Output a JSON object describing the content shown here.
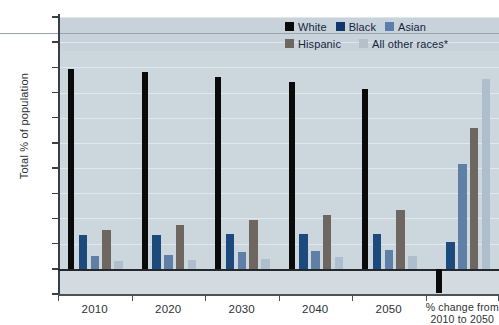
{
  "chart": {
    "type": "bar",
    "ylabel": "Total % of population",
    "ytick_labels": [
      "100",
      "90",
      "80",
      "70",
      "60",
      "50",
      "40",
      "30",
      "20",
      "10",
      "0",
      "-10"
    ],
    "xtick_labels": [
      "2010",
      "2020",
      "2030",
      "2040",
      "2050",
      "% change from\n2010 to 2050"
    ],
    "footnote": ""
  },
  "legend": {
    "row1": [
      {
        "label": "White",
        "color": "#0a0a0a",
        "swatch": "sw-white"
      },
      {
        "label": "Black",
        "color": "#10386b",
        "swatch": "sw-black"
      },
      {
        "label": "Asian",
        "color": "#5a7fad",
        "swatch": "sw-asian"
      }
    ],
    "row2": [
      {
        "label": "Hispanic",
        "color": "#6d6661",
        "swatch": "sw-hispanic"
      },
      {
        "label": "All other races*",
        "color": "#b3c1cd",
        "swatch": "sw-other"
      }
    ]
  },
  "chart_data": {
    "type": "bar",
    "title": "",
    "subtitle": "",
    "xlabel": "",
    "ylabel": "Total % of population",
    "categories": [
      "2010",
      "2020",
      "2030",
      "2040",
      "2050",
      "% change from 2010 to 2050"
    ],
    "series": [
      {
        "name": "White",
        "color": "#0a0a0a",
        "values": [
          79.5,
          78.0,
          76.0,
          74.0,
          71.5,
          -9.5
        ]
      },
      {
        "name": "Black",
        "color": "#1c4a7d",
        "values": [
          13.5,
          13.5,
          13.8,
          14.0,
          14.0,
          10.5
        ]
      },
      {
        "name": "Asian",
        "color": "#5f7fa6",
        "values": [
          5.0,
          5.5,
          6.5,
          7.0,
          7.5,
          41.5
        ]
      },
      {
        "name": "Hispanic",
        "color": "#6d6661",
        "values": [
          15.5,
          17.5,
          19.5,
          21.5,
          23.5,
          56.0
        ]
      },
      {
        "name": "All other races*",
        "color": "#aebecd",
        "values": [
          3.0,
          3.5,
          4.0,
          4.5,
          5.0,
          75.5
        ]
      }
    ],
    "ylim": [
      -10,
      100
    ],
    "ytick_values": [
      -10,
      0,
      10,
      20,
      30,
      40,
      50,
      60,
      70,
      80,
      90,
      100
    ],
    "grid": true,
    "legend_position": "top-right",
    "legend_entries": [
      "White",
      "Black",
      "Asian",
      "Hispanic",
      "All other races*"
    ]
  }
}
